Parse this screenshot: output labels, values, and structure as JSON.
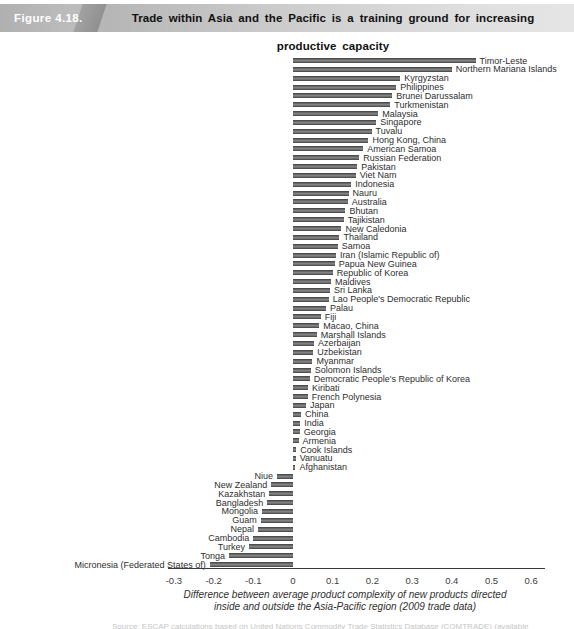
{
  "header": {
    "figure_label": "Figure 4.18.",
    "title": "Trade within Asia and the Pacific is a training ground for increasing productive capacity"
  },
  "chart_data": {
    "type": "bar",
    "orientation": "horizontal",
    "title": "Trade within Asia and the Pacific is a training ground for increasing productive capacity",
    "xlabel_line1": "Difference between average product complexity of new products directed",
    "xlabel_line2": "inside and outside the Asia-Pacific region (2009 trade data)",
    "x_ticks": [
      "-0.3",
      "-0.2",
      "-0.1",
      "0",
      "0.1",
      "0.2",
      "0.3",
      "0.4",
      "0.5",
      "0.6"
    ],
    "xlim": [
      -0.31,
      0.635
    ],
    "grid": false,
    "legend": "none",
    "bar_color": "#4f4f4f",
    "categories": [
      "Timor-Leste",
      "Northern Mariana Islands",
      "Kyrgyzstan",
      "Philippines",
      "Brunei Darussalam",
      "Turkmenistan",
      "Malaysia",
      "Singapore",
      "Tuvalu",
      "Hong Kong, China",
      "American Samoa",
      "Russian Federation",
      "Pakistan",
      "Viet Nam",
      "Indonesia",
      "Nauru",
      "Australia",
      "Bhutan",
      "Tajikistan",
      "New Caledonia",
      "Thailand",
      "Samoa",
      "Iran (Islamic Republic of)",
      "Papua New Guinea",
      "Republic of Korea",
      "Maldives",
      "Sri Lanka",
      "Lao People's Democratic Republic",
      "Palau",
      "Fiji",
      "Macao, China",
      "Marshall Islands",
      "Azerbaijan",
      "Uzbekistan",
      "Myanmar",
      "Solomon Islands",
      "Democratic People's Republic of Korea",
      "Kiribati",
      "French Polynesia",
      "Japan",
      "China",
      "India",
      "Georgia",
      "Armenia",
      "Cook Islands",
      "Vanuatu",
      "Afghanistan",
      "Niue",
      "New Zealand",
      "Kazakhstan",
      "Bangladesh",
      "Mongolia",
      "Guam",
      "Nepal",
      "Cambodia",
      "Turkey",
      "Tonga",
      "Micronesia (Federated States of)"
    ],
    "values": [
      0.46,
      0.4,
      0.27,
      0.26,
      0.25,
      0.245,
      0.215,
      0.21,
      0.198,
      0.19,
      0.177,
      0.167,
      0.162,
      0.158,
      0.147,
      0.14,
      0.138,
      0.132,
      0.128,
      0.122,
      0.117,
      0.113,
      0.108,
      0.105,
      0.1,
      0.096,
      0.093,
      0.09,
      0.083,
      0.07,
      0.066,
      0.06,
      0.053,
      0.051,
      0.049,
      0.045,
      0.042,
      0.038,
      0.037,
      0.033,
      0.02,
      0.018,
      0.017,
      0.014,
      0.008,
      0.007,
      0.006,
      -0.04,
      -0.055,
      -0.06,
      -0.065,
      -0.078,
      -0.081,
      -0.088,
      -0.1,
      -0.111,
      -0.161,
      -0.21
    ]
  },
  "footer": {
    "source_fragment": "Source: ESCAP calculations based on United Nations Commodity Trade Statistics Database (COMTRADE) (available"
  }
}
